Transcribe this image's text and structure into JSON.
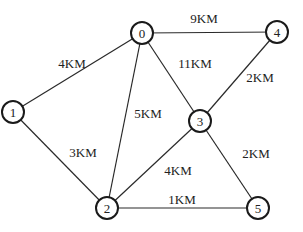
{
  "graph": {
    "nodes": [
      {
        "id": "0",
        "label": "0",
        "x": 142,
        "y": 33
      },
      {
        "id": "1",
        "label": "1",
        "x": 13,
        "y": 112
      },
      {
        "id": "2",
        "label": "2",
        "x": 107,
        "y": 208
      },
      {
        "id": "3",
        "label": "3",
        "x": 200,
        "y": 121
      },
      {
        "id": "4",
        "label": "4",
        "x": 277,
        "y": 32
      },
      {
        "id": "5",
        "label": "5",
        "x": 258,
        "y": 208
      }
    ],
    "edges": [
      {
        "from": "0",
        "to": "4",
        "label": "9KM",
        "lx": 204,
        "ly": 18
      },
      {
        "from": "0",
        "to": "1",
        "label": "4KM",
        "lx": 72,
        "ly": 63
      },
      {
        "from": "0",
        "to": "3",
        "label": "11KM",
        "lx": 195,
        "ly": 63
      },
      {
        "from": "4",
        "to": "3",
        "label": "2KM",
        "lx": 260,
        "ly": 77
      },
      {
        "from": "0",
        "to": "2",
        "label": "5KM",
        "lx": 148,
        "ly": 113
      },
      {
        "from": "1",
        "to": "2",
        "label": "3KM",
        "lx": 83,
        "ly": 152
      },
      {
        "from": "3",
        "to": "2",
        "label": "4KM",
        "lx": 178,
        "ly": 170
      },
      {
        "from": "3",
        "to": "5",
        "label": "2KM",
        "lx": 256,
        "ly": 153
      },
      {
        "from": "2",
        "to": "5",
        "label": "1KM",
        "lx": 182,
        "ly": 199
      }
    ]
  },
  "style": {
    "node_radius": 11,
    "stroke_color": "#1a1a1a",
    "background": "#ffffff"
  }
}
